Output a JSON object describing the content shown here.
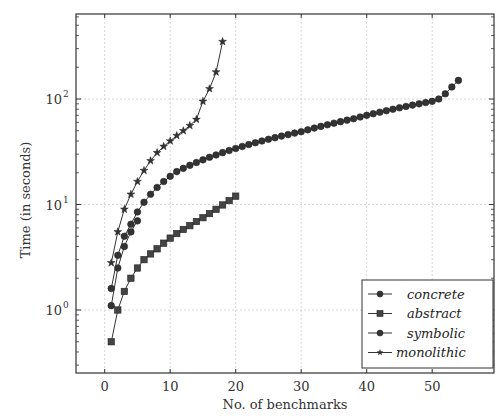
{
  "chart_data": {
    "type": "line",
    "title": "",
    "xlabel": "No. of benchmarks",
    "ylabel": "Time (in seconds)",
    "xscale": "linear",
    "yscale": "log",
    "xlim": [
      -4,
      59
    ],
    "ylim": [
      0.22,
      600
    ],
    "xticks": [
      0,
      10,
      20,
      30,
      40,
      50
    ],
    "yticks": [
      {
        "value": 1,
        "label": "10",
        "exp": "0"
      },
      {
        "value": 10,
        "label": "10",
        "exp": "1"
      },
      {
        "value": 100,
        "label": "10",
        "exp": "2"
      }
    ],
    "grid": true,
    "legend_position": "lower right",
    "series": [
      {
        "name": "concrete",
        "marker": "circle",
        "x": [
          1,
          2,
          3,
          4,
          5
        ],
        "values": [
          1.1,
          2.5,
          4.0,
          5.5,
          7.0
        ]
      },
      {
        "name": "abstract",
        "marker": "square",
        "x": [
          1,
          2,
          3,
          4,
          5,
          6,
          7,
          8,
          9,
          10,
          11,
          12,
          13,
          14,
          15,
          16,
          17,
          18,
          19,
          20
        ],
        "values": [
          0.5,
          1.0,
          1.5,
          2.0,
          2.5,
          3.0,
          3.4,
          3.8,
          4.3,
          4.8,
          5.3,
          5.8,
          6.3,
          6.9,
          7.5,
          8.2,
          9.0,
          9.9,
          10.9,
          12.0
        ]
      },
      {
        "name": "symbolic",
        "marker": "circle",
        "x": [
          1,
          2,
          3,
          4,
          5,
          6,
          7,
          8,
          9,
          10,
          11,
          12,
          13,
          14,
          15,
          16,
          17,
          18,
          19,
          20,
          21,
          22,
          23,
          24,
          25,
          26,
          27,
          28,
          29,
          30,
          31,
          32,
          33,
          34,
          35,
          36,
          37,
          38,
          39,
          40,
          41,
          42,
          43,
          44,
          45,
          46,
          47,
          48,
          49,
          50,
          51,
          52,
          53,
          54
        ],
        "values": [
          1.6,
          3.3,
          5.0,
          6.5,
          8.5,
          10.5,
          12.5,
          14.5,
          16.5,
          18.5,
          20.5,
          22.0,
          23.5,
          25.0,
          26.5,
          28.0,
          29.5,
          31.0,
          32.5,
          34.0,
          35.5,
          37.0,
          38.5,
          40.0,
          41.5,
          43.0,
          44.5,
          46.0,
          47.5,
          49.0,
          51.0,
          53.0,
          55.0,
          57.0,
          59.0,
          61.0,
          63.0,
          65.0,
          67.5,
          70.0,
          72.5,
          75.0,
          77.5,
          80.0,
          82.5,
          85.0,
          87.5,
          90.0,
          92.5,
          95.0,
          100.0,
          112.0,
          130.0,
          150.0
        ]
      },
      {
        "name": "monolithic",
        "marker": "star",
        "x": [
          1,
          2,
          3,
          4,
          5,
          6,
          7,
          8,
          9,
          10,
          11,
          12,
          13,
          14,
          15,
          16,
          17,
          18
        ],
        "values": [
          2.8,
          5.5,
          9.0,
          12.5,
          16.5,
          21.0,
          26.0,
          31.0,
          35.5,
          40.0,
          45.0,
          50.0,
          56.0,
          64.0,
          95.0,
          125.0,
          180.0,
          350.0
        ]
      }
    ]
  }
}
